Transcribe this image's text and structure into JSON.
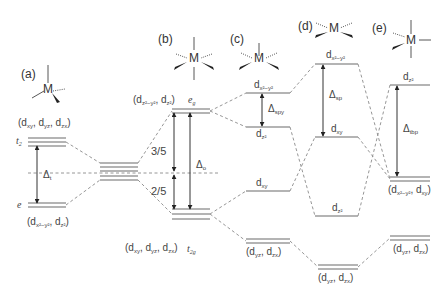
{
  "panels": [
    {
      "id": "a",
      "label": "(a)",
      "geometry": "tetrahedral"
    },
    {
      "id": "b",
      "label": "(b)",
      "geometry": "octahedral"
    },
    {
      "id": "c",
      "label": "(c)",
      "geometry": "square pyramidal"
    },
    {
      "id": "d",
      "label": "(d)",
      "geometry": "square planar"
    },
    {
      "id": "e",
      "label": "(e)",
      "geometry": "trigonal bipyramidal"
    }
  ],
  "metal_symbol": "M",
  "tetrahedral": {
    "upper_set_symbol": "t",
    "upper_set_sub": "2",
    "upper_orbitals": [
      "xy",
      "yz",
      "zx"
    ],
    "lower_set_symbol": "e",
    "lower_orbitals": [
      "x²−y²",
      "z²"
    ],
    "splitting_symbol": "Δ",
    "splitting_sub": "t"
  },
  "octahedral": {
    "upper_set_symbol": "e",
    "upper_set_sub": "g",
    "upper_orbitals": [
      "z²−y²",
      "z²"
    ],
    "lower_set_symbol": "t",
    "lower_set_sub": "2g",
    "lower_orbitals": [
      "xy",
      "yz",
      "zx"
    ],
    "fraction_upper": "3/5",
    "fraction_lower": "2/5",
    "splitting_symbol": "Δ",
    "splitting_sub": "o"
  },
  "square_pyramidal": {
    "levels": [
      "x²−y²",
      "z²",
      "xy"
    ],
    "lowest_orbitals": [
      "yz",
      "zx"
    ],
    "splitting_symbol": "Δ",
    "splitting_sub": "spy"
  },
  "square_planar": {
    "levels": [
      "x²−y²",
      "xy",
      "z²"
    ],
    "lowest_orbitals": [
      "yz",
      "zx"
    ],
    "splitting_symbol": "Δ",
    "splitting_sub": "sp"
  },
  "trigonal_bipyramidal": {
    "top_level": "z²",
    "middle_orbitals": [
      "x²−y²",
      "xy"
    ],
    "lowest_orbitals": [
      "yz",
      "zx"
    ],
    "splitting_symbol": "Δ",
    "splitting_sub": "tbp"
  },
  "orbital_prefix": "d",
  "colors": {
    "levels": "#666666",
    "dashed": "#888888",
    "arrows": "#333333",
    "text": "#444444"
  }
}
